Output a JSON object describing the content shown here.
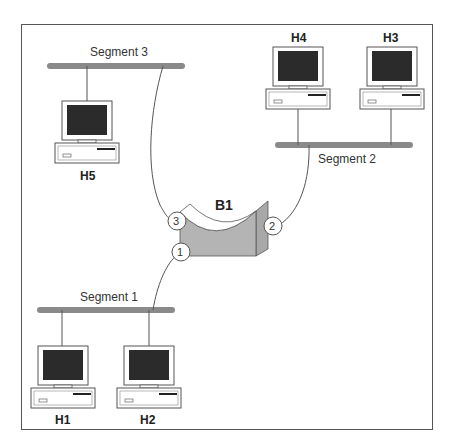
{
  "diagram": {
    "type": "network-topology",
    "colors": {
      "segment": "#8a8a8a",
      "bridge": "#b4b4b4",
      "screen": "#2b2b2b",
      "frame": "#555555"
    },
    "bridge": {
      "label": "B1",
      "ports": [
        "1",
        "2",
        "3"
      ]
    },
    "segments": [
      {
        "id": "seg1",
        "label": "Segment 1"
      },
      {
        "id": "seg2",
        "label": "Segment 2"
      },
      {
        "id": "seg3",
        "label": "Segment 3"
      }
    ],
    "hosts": [
      {
        "id": "h1",
        "label": "H1",
        "segment": "Segment 1"
      },
      {
        "id": "h2",
        "label": "H2",
        "segment": "Segment 1"
      },
      {
        "id": "h3",
        "label": "H3",
        "segment": "Segment 2"
      },
      {
        "id": "h4",
        "label": "H4",
        "segment": "Segment 2"
      },
      {
        "id": "h5",
        "label": "H5",
        "segment": "Segment 3"
      }
    ],
    "links": [
      {
        "from": "Segment 1",
        "to": "B1",
        "port": "1"
      },
      {
        "from": "Segment 2",
        "to": "B1",
        "port": "2"
      },
      {
        "from": "Segment 3",
        "to": "B1",
        "port": "3"
      }
    ]
  }
}
